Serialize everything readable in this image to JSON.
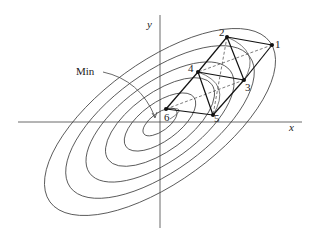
{
  "diagram": {
    "type": "simplex-search-on-contours",
    "axes": {
      "x_label": "x",
      "y_label": "y"
    },
    "annotation": {
      "label": "Min"
    },
    "points": [
      {
        "id": "1",
        "label": "1"
      },
      {
        "id": "2",
        "label": "2"
      },
      {
        "id": "3",
        "label": "3"
      },
      {
        "id": "4",
        "label": "4"
      },
      {
        "id": "5",
        "label": "5"
      },
      {
        "id": "6",
        "label": "6"
      }
    ],
    "contour_count": 6
  }
}
